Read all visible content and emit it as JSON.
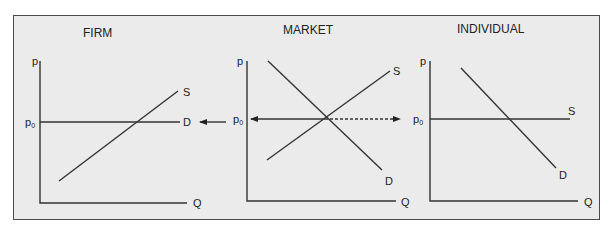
{
  "panels": [
    {
      "title": "FIRM",
      "y_axis": "p",
      "x_axis": "Q",
      "price_label": "p",
      "price_subscript": "0",
      "curves": [
        {
          "name": "S",
          "type": "upward"
        },
        {
          "name": "D",
          "type": "horizontal at p0"
        }
      ]
    },
    {
      "title": "MARKET",
      "y_axis": "p",
      "x_axis": "Q",
      "price_label": "p",
      "price_subscript": "0",
      "curves": [
        {
          "name": "S",
          "type": "upward"
        },
        {
          "name": "D",
          "type": "downward"
        }
      ]
    },
    {
      "title": "INDIVIDUAL",
      "y_axis": "p",
      "x_axis": "Q",
      "price_label": "p",
      "price_subscript": "0",
      "curves": [
        {
          "name": "S",
          "type": "horizontal at p0"
        },
        {
          "name": "D",
          "type": "downward"
        }
      ]
    }
  ],
  "annotations": {
    "left_arrow": "market price p0 transmitted to firm (horizontal demand)",
    "right_arrow_dashed": "market price p0 transmitted to individual (horizontal supply)"
  },
  "colors": {
    "background": "#ebebeb",
    "line": "#333333",
    "border": "#4a4a4a"
  }
}
